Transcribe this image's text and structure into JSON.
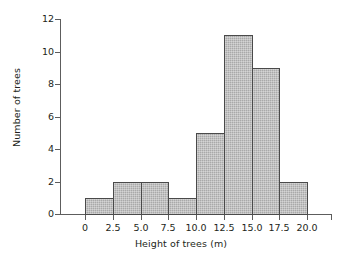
{
  "chart_data": {
    "type": "bar",
    "title": "",
    "subtitle": "",
    "xlabel": "Height of trees (m)",
    "ylabel": "Number of trees",
    "categories": [
      "0-2.5",
      "2.5-5.0",
      "5.0-7.5",
      "7.5-10.0",
      "10.0-12.5",
      "12.5-15.0",
      "15.0-17.5",
      "17.5-20.0"
    ],
    "bin_edges": [
      0,
      2.5,
      5.0,
      7.5,
      10.0,
      12.5,
      15.0,
      17.5,
      20.0
    ],
    "values": [
      1,
      2,
      2,
      1,
      5,
      11,
      9,
      2
    ],
    "bin_width": 2.5,
    "xlim": [
      0,
      20
    ],
    "ylim": [
      0,
      12
    ],
    "xticks": [
      0,
      2.5,
      5.0,
      7.5,
      10.0,
      12.5,
      15.0,
      17.5,
      20.0
    ],
    "xtick_labels": [
      "0",
      "2.5",
      "5.0",
      "7.5",
      "10.0",
      "12.5",
      "15.0",
      "17.5",
      "20.0"
    ],
    "yticks": [
      0,
      2,
      4,
      6,
      8,
      10,
      12
    ],
    "ytick_labels": [
      "0",
      "2",
      "4",
      "6",
      "8",
      "10",
      "12"
    ],
    "grid": false,
    "legend": false,
    "legend_position": "none",
    "bar_fill_color": "#a9a9a9",
    "bar_edge_color": "#4a4a4a",
    "axis_color": "#5d5d5d",
    "text_color": "#231f20",
    "background_color": "#ffffff"
  }
}
